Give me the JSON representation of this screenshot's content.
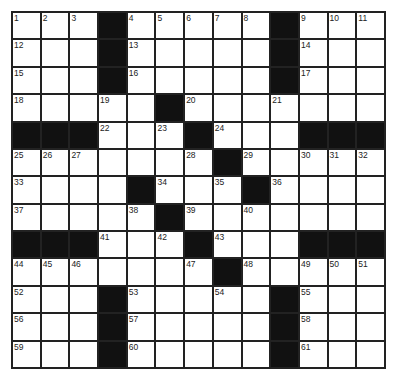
{
  "puzzle": {
    "rows": 13,
    "cols": 13,
    "colors": {
      "black": "#111111",
      "white": "#ffffff",
      "line": "#222222"
    },
    "grid": [
      [
        "1",
        "2",
        "3",
        "#",
        "4",
        "5",
        "6",
        "7",
        "8",
        "#",
        "9",
        "10",
        "11"
      ],
      [
        "12",
        "",
        "",
        "#",
        "13",
        "",
        "",
        "",
        "",
        "#",
        "14",
        "",
        ""
      ],
      [
        "15",
        "",
        "",
        "#",
        "16",
        "",
        "",
        "",
        "",
        "#",
        "17",
        "",
        ""
      ],
      [
        "18",
        "",
        "",
        "19",
        "",
        "#",
        "20",
        "",
        "",
        "21",
        "",
        "",
        ""
      ],
      [
        "#",
        "#",
        "#",
        "22",
        "",
        "23",
        "#",
        "24",
        "",
        "",
        "#",
        "#",
        "#"
      ],
      [
        "25",
        "26",
        "27",
        "",
        "",
        "",
        "28",
        "#",
        "29",
        "",
        "30",
        "31",
        "32"
      ],
      [
        "33",
        "",
        "",
        "",
        "#",
        "34",
        "",
        "35",
        "#",
        "36",
        "",
        "",
        ""
      ],
      [
        "37",
        "",
        "",
        "",
        "38",
        "#",
        "39",
        "",
        "40",
        "",
        "",
        "",
        ""
      ],
      [
        "#",
        "#",
        "#",
        "41",
        "",
        "42",
        "#",
        "43",
        "",
        "",
        "#",
        "#",
        "#"
      ],
      [
        "44",
        "45",
        "46",
        "",
        "",
        "",
        "47",
        "#",
        "48",
        "",
        "49",
        "50",
        "51"
      ],
      [
        "52",
        "",
        "",
        "#",
        "53",
        "",
        "",
        "54",
        "",
        "#",
        "55",
        "",
        ""
      ],
      [
        "56",
        "",
        "",
        "#",
        "57",
        "",
        "",
        "",
        "",
        "#",
        "58",
        "",
        ""
      ],
      [
        "59",
        "",
        "",
        "#",
        "60",
        "",
        "",
        "",
        "",
        "#",
        "61",
        "",
        ""
      ]
    ]
  }
}
